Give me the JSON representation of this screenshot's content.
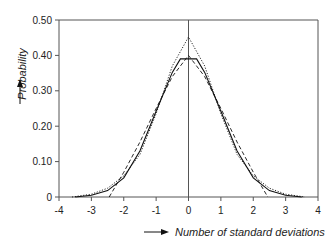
{
  "chart_data": {
    "type": "line",
    "title": "",
    "xlabel": "Number of standard deviations",
    "ylabel": "Probability",
    "xlim": [
      -4,
      4
    ],
    "ylim": [
      0,
      0.5
    ],
    "x_ticks": [
      "-4",
      "-3",
      "-2",
      "-1",
      "0",
      "1",
      "2",
      "3",
      "4"
    ],
    "y_ticks": [
      "0",
      "0.10",
      "0.20",
      "0.30",
      "0.40",
      "0.50"
    ],
    "grid": false,
    "legend": null,
    "series": [
      {
        "name": "solid",
        "style": "solid",
        "points": [
          [
            -3.5,
            0
          ],
          [
            -3,
            0.005
          ],
          [
            -2.5,
            0.018
          ],
          [
            -2,
            0.054
          ],
          [
            -1.5,
            0.13
          ],
          [
            -1,
            0.242
          ],
          [
            -0.5,
            0.352
          ],
          [
            -0.25,
            0.39
          ],
          [
            0.25,
            0.39
          ],
          [
            0.5,
            0.352
          ],
          [
            1,
            0.242
          ],
          [
            1.5,
            0.13
          ],
          [
            2,
            0.054
          ],
          [
            2.5,
            0.018
          ],
          [
            3,
            0.005
          ],
          [
            3.5,
            0
          ]
        ]
      },
      {
        "name": "dashed",
        "style": "dashed",
        "points": [
          [
            -2.45,
            0
          ],
          [
            -2,
            0.07
          ],
          [
            -1.5,
            0.155
          ],
          [
            -1,
            0.25
          ],
          [
            -0.5,
            0.34
          ],
          [
            0,
            0.4
          ],
          [
            0.5,
            0.34
          ],
          [
            1,
            0.25
          ],
          [
            1.5,
            0.155
          ],
          [
            2,
            0.07
          ],
          [
            2.45,
            0
          ]
        ]
      },
      {
        "name": "dotted",
        "style": "dotted",
        "points": [
          [
            -3.6,
            0
          ],
          [
            -3,
            0.008
          ],
          [
            -2.5,
            0.025
          ],
          [
            -2,
            0.06
          ],
          [
            -1.5,
            0.12
          ],
          [
            -1,
            0.235
          ],
          [
            -0.5,
            0.37
          ],
          [
            0,
            0.452
          ],
          [
            0.5,
            0.37
          ],
          [
            1,
            0.235
          ],
          [
            1.5,
            0.12
          ],
          [
            2,
            0.06
          ],
          [
            2.5,
            0.025
          ],
          [
            3,
            0.008
          ],
          [
            3.6,
            0
          ]
        ]
      }
    ]
  }
}
